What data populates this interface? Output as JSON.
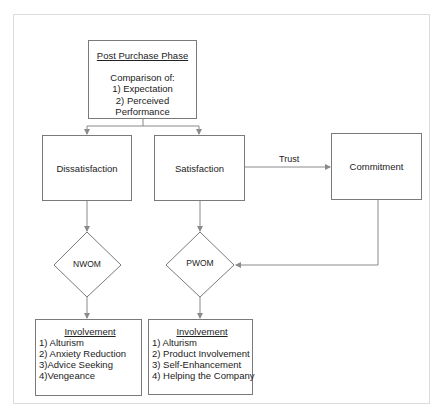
{
  "diagram": {
    "top_box": {
      "title": "Post Purchase Phase",
      "lines": [
        "Comparison of:",
        "1) Expectation",
        "2) Perceived Performance"
      ]
    },
    "nodes": {
      "dissatisfaction": "Dissatisfaction",
      "satisfaction": "Satisfaction",
      "commitment": "Commitment",
      "nwom": "NWOM",
      "pwom": "PWOM"
    },
    "edges": {
      "trust_label": "Trust"
    },
    "left_involvement": {
      "heading": "Involvement",
      "items": [
        "1) Alturism",
        "2) Anxiety Reduction",
        "3)Advice Seeking",
        "4)Vengeance"
      ]
    },
    "right_involvement": {
      "heading": "Involvement",
      "items": [
        "1) Alturism",
        "2) Product Involvement",
        "3) Self-Enhancement",
        "4) Helping the Company"
      ]
    },
    "colors": {
      "line": "#8a8a8a",
      "box_border": "#7a7a7a",
      "frame_border": "#dcdcdc"
    }
  }
}
